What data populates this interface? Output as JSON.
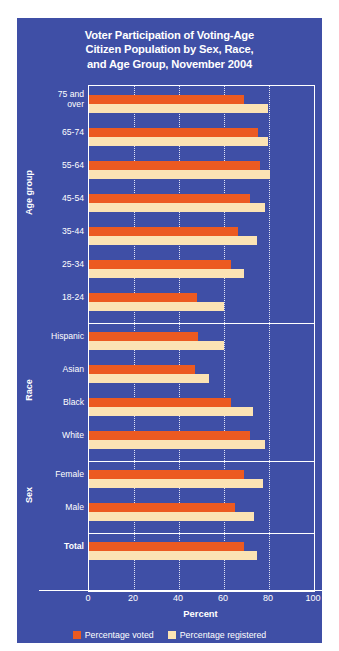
{
  "chart_data": {
    "type": "bar",
    "orientation": "horizontal",
    "title": "Voter Participation of Voting-Age Citizen Population by Sex, Race, and Age Group, November 2004",
    "title_lines": [
      "Voter Participation of Voting-Age",
      "Citizen Population by Sex, Race,",
      "and Age Group, November 2004"
    ],
    "xlabel": "Percent",
    "ylabel": "",
    "xlim": [
      0,
      100
    ],
    "xticks": [
      0,
      20,
      40,
      60,
      80,
      100
    ],
    "xtick_labels": [
      "0",
      "20",
      "40",
      "60",
      "80",
      "100"
    ],
    "gridlines": [
      20,
      40,
      60,
      80
    ],
    "grid": true,
    "legend_position": "bottom",
    "series": [
      {
        "name": "Percentage voted",
        "color": "#ec5a21",
        "values": [
          69.0,
          75.0,
          76.0,
          71.5,
          66.0,
          63.0,
          48.0,
          48.5,
          47.0,
          63.0,
          71.5,
          69.0,
          65.0,
          69.0
        ]
      },
      {
        "name": "Percentage registered",
        "color": "#fbe3b4",
        "values": [
          79.5,
          79.5,
          80.5,
          78.0,
          74.5,
          69.0,
          60.0,
          60.0,
          53.5,
          73.0,
          78.0,
          77.5,
          73.5,
          74.5
        ]
      }
    ],
    "categories": [
      "75 and over",
      "65-74",
      "55-64",
      "45-54",
      "35-44",
      "25-34",
      "18-24",
      "Hispanic",
      "Asian",
      "Black",
      "White",
      "Female",
      "Male",
      "Total"
    ],
    "groups": [
      {
        "title": "Age group",
        "categories": [
          {
            "label": "75 and\nover",
            "voted": 69.0,
            "registered": 79.5
          },
          {
            "label": "65-74",
            "voted": 75.0,
            "registered": 79.5
          },
          {
            "label": "55-64",
            "voted": 76.0,
            "registered": 80.5
          },
          {
            "label": "45-54",
            "voted": 71.5,
            "registered": 78.0
          },
          {
            "label": "35-44",
            "voted": 66.0,
            "registered": 74.5
          },
          {
            "label": "25-34",
            "voted": 63.0,
            "registered": 69.0
          },
          {
            "label": "18-24",
            "voted": 48.0,
            "registered": 60.0
          }
        ]
      },
      {
        "title": "Race",
        "categories": [
          {
            "label": "Hispanic",
            "voted": 48.5,
            "registered": 60.0
          },
          {
            "label": "Asian",
            "voted": 47.0,
            "registered": 53.5
          },
          {
            "label": "Black",
            "voted": 63.0,
            "registered": 73.0
          },
          {
            "label": "White",
            "voted": 71.5,
            "registered": 78.0
          }
        ]
      },
      {
        "title": "Sex",
        "categories": [
          {
            "label": "Female",
            "voted": 69.0,
            "registered": 77.5
          },
          {
            "label": "Male",
            "voted": 65.0,
            "registered": 73.5
          }
        ]
      },
      {
        "title": "",
        "categories": [
          {
            "label": "Total",
            "voted": 69.0,
            "registered": 74.5,
            "bold": true
          }
        ]
      }
    ]
  },
  "colors": {
    "background": "#3f4fa6",
    "voted": "#ec5a21",
    "registered": "#fbe3b4",
    "text": "#ffffff",
    "grid": "#dfe3f5"
  },
  "legend": {
    "items": [
      {
        "label": "Percentage voted",
        "color": "#ec5a21"
      },
      {
        "label": "Percentage registered",
        "color": "#fbe3b4"
      }
    ]
  }
}
